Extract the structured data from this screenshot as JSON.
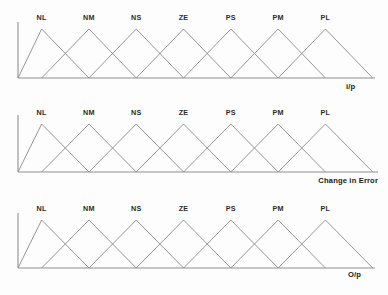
{
  "figure": {
    "background_color": "#fdfdfd",
    "line_color": "#8a8a8a",
    "axis_color": "#8f8f8f",
    "text_color": "#2b2b2b"
  },
  "chart_data": [
    {
      "type": "line",
      "title": "",
      "xlabel": "i/p",
      "ylabel": "",
      "grid": false,
      "legend": "none",
      "xlim": [
        0,
        7
      ],
      "ylim": [
        0,
        1
      ],
      "description": "Seven overlapping triangular fuzzy membership functions for the input variable",
      "categories": [
        "NL",
        "NM",
        "NS",
        "ZE",
        "PS",
        "PM",
        "PL"
      ],
      "series": [
        {
          "name": "NL",
          "points": [
            [
              0,
              0
            ],
            [
              0.5,
              1
            ],
            [
              1.5,
              0
            ]
          ]
        },
        {
          "name": "NM",
          "points": [
            [
              0.5,
              0
            ],
            [
              1.5,
              1
            ],
            [
              2.5,
              0
            ]
          ]
        },
        {
          "name": "NS",
          "points": [
            [
              1.5,
              0
            ],
            [
              2.5,
              1
            ],
            [
              3.5,
              0
            ]
          ]
        },
        {
          "name": "ZE",
          "points": [
            [
              2.5,
              0
            ],
            [
              3.5,
              1
            ],
            [
              4.5,
              0
            ]
          ]
        },
        {
          "name": "PS",
          "points": [
            [
              3.5,
              0
            ],
            [
              4.5,
              1
            ],
            [
              5.5,
              0
            ]
          ]
        },
        {
          "name": "PM",
          "points": [
            [
              4.5,
              0
            ],
            [
              5.5,
              1
            ],
            [
              6.5,
              0
            ]
          ]
        },
        {
          "name": "PL",
          "points": [
            [
              5.5,
              0
            ],
            [
              6.5,
              1
            ],
            [
              7.5,
              0
            ]
          ]
        }
      ]
    },
    {
      "type": "line",
      "title": "",
      "xlabel": "Change in Error",
      "ylabel": "",
      "grid": false,
      "legend": "none",
      "xlim": [
        0,
        7
      ],
      "ylim": [
        0,
        1
      ],
      "description": "Seven overlapping triangular fuzzy membership functions for the change-in-error variable",
      "categories": [
        "NL",
        "NM",
        "NS",
        "ZE",
        "PS",
        "PM",
        "PL"
      ],
      "series": [
        {
          "name": "NL",
          "points": [
            [
              0,
              0
            ],
            [
              0.5,
              1
            ],
            [
              1.5,
              0
            ]
          ]
        },
        {
          "name": "NM",
          "points": [
            [
              0.5,
              0
            ],
            [
              1.5,
              1
            ],
            [
              2.5,
              0
            ]
          ]
        },
        {
          "name": "NS",
          "points": [
            [
              1.5,
              0
            ],
            [
              2.5,
              1
            ],
            [
              3.5,
              0
            ]
          ]
        },
        {
          "name": "ZE",
          "points": [
            [
              2.5,
              0
            ],
            [
              3.5,
              1
            ],
            [
              4.5,
              0
            ]
          ]
        },
        {
          "name": "PS",
          "points": [
            [
              3.5,
              0
            ],
            [
              4.5,
              1
            ],
            [
              5.5,
              0
            ]
          ]
        },
        {
          "name": "PM",
          "points": [
            [
              4.5,
              0
            ],
            [
              5.5,
              1
            ],
            [
              6.5,
              0
            ]
          ]
        },
        {
          "name": "PL",
          "points": [
            [
              5.5,
              0
            ],
            [
              6.5,
              1
            ],
            [
              7.5,
              0
            ]
          ]
        }
      ]
    },
    {
      "type": "line",
      "title": "",
      "xlabel": "O/p",
      "ylabel": "",
      "grid": false,
      "legend": "none",
      "xlim": [
        0,
        7
      ],
      "ylim": [
        0,
        1
      ],
      "description": "Seven overlapping triangular fuzzy membership functions for the output variable",
      "categories": [
        "NL",
        "NM",
        "NS",
        "ZE",
        "PS",
        "PM",
        "PL"
      ],
      "series": [
        {
          "name": "NL",
          "points": [
            [
              0,
              0
            ],
            [
              0.5,
              1
            ],
            [
              1.5,
              0
            ]
          ]
        },
        {
          "name": "NM",
          "points": [
            [
              0.5,
              0
            ],
            [
              1.5,
              1
            ],
            [
              2.5,
              0
            ]
          ]
        },
        {
          "name": "NS",
          "points": [
            [
              1.5,
              0
            ],
            [
              2.5,
              1
            ],
            [
              3.5,
              0
            ]
          ]
        },
        {
          "name": "ZE",
          "points": [
            [
              2.5,
              0
            ],
            [
              3.5,
              1
            ],
            [
              4.5,
              0
            ]
          ]
        },
        {
          "name": "PS",
          "points": [
            [
              3.5,
              0
            ],
            [
              4.5,
              1
            ],
            [
              5.5,
              0
            ]
          ]
        },
        {
          "name": "PM",
          "points": [
            [
              4.5,
              0
            ],
            [
              5.5,
              1
            ],
            [
              6.5,
              0
            ]
          ]
        },
        {
          "name": "PL",
          "points": [
            [
              5.5,
              0
            ],
            [
              6.5,
              1
            ],
            [
              7.5,
              0
            ]
          ]
        }
      ]
    }
  ],
  "charts": [
    {
      "id": "input",
      "labels": [
        "NL",
        "NM",
        "NS",
        "ZE",
        "PS",
        "PM",
        "PL"
      ],
      "axis_label": "i/p",
      "axis_label_align": "left"
    },
    {
      "id": "change-in-error",
      "labels": [
        "NL",
        "NM",
        "NS",
        "ZE",
        "PS",
        "PM",
        "PL"
      ],
      "axis_label": "Change in Error",
      "axis_label_align": "right"
    },
    {
      "id": "output",
      "labels": [
        "NL",
        "NM",
        "NS",
        "ZE",
        "PS",
        "PM",
        "PL"
      ],
      "axis_label": "O/p",
      "axis_label_align": "left"
    }
  ]
}
